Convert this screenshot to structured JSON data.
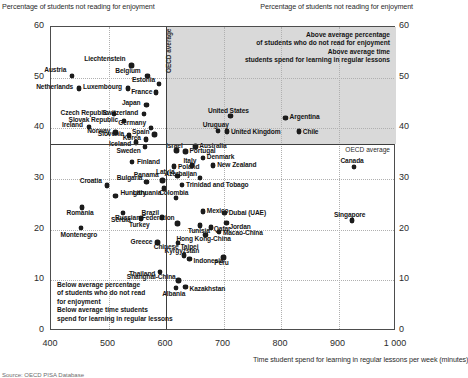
{
  "chart_data": {
    "type": "scatter",
    "title": "",
    "ylabel_left": "Percentage of students not reading for enjoyment",
    "ylabel_right": "Percentage of students not reading for enjoyment",
    "xlabel": "Time student spend for learning in regular lessons per week (minutes)",
    "xlim": [
      400,
      1000
    ],
    "ylim": [
      0,
      60
    ],
    "xticks": [
      400,
      500,
      600,
      700,
      800,
      900,
      1000
    ],
    "yticks": [
      0,
      10,
      20,
      30,
      40,
      50,
      60
    ],
    "grid": true,
    "oecd_average_x": 600,
    "oecd_average_y": 37,
    "oecd_vline_label": "OECD average",
    "oecd_hline_label": "OECD average",
    "annotations": {
      "top_right": "Above average percentage\nof students who do not read for enjoyment\nAbove average time\nstudents spend for learning in regular lessons",
      "bottom_left": "Below average percentage\nof students who do not read\nfor enjoyment\nBelow average time students\nspend for learning in regular lessons"
    },
    "points": [
      {
        "name": "Austria",
        "x": 437,
        "y": 50.3,
        "lx": -6,
        "ly": -7,
        "align": "r"
      },
      {
        "name": "Netherlands",
        "x": 449,
        "y": 47.9,
        "lx": -6,
        "ly": -2,
        "align": "r"
      },
      {
        "name": "Liechtenstein",
        "x": 540,
        "y": 52.4,
        "lx": -6,
        "ly": -7,
        "align": "r"
      },
      {
        "name": "Belgium",
        "x": 568,
        "y": 50.3,
        "lx": -7,
        "ly": -6,
        "align": "r"
      },
      {
        "name": "Luxembourg",
        "x": 534,
        "y": 47.9,
        "lx": -6,
        "ly": -2,
        "align": "r"
      },
      {
        "name": "Estonia",
        "x": 588,
        "y": 48.7,
        "lx": -4,
        "ly": -5,
        "align": "r"
      },
      {
        "name": "France",
        "x": 583,
        "y": 47.1,
        "lx": -4,
        "ly": -1,
        "align": "r"
      },
      {
        "name": "Japan",
        "x": 566,
        "y": 44.6,
        "lx": -6,
        "ly": -3,
        "align": "r"
      },
      {
        "name": "Czech Republic",
        "x": 510,
        "y": 42.8,
        "lx": -6,
        "ly": -2,
        "align": "r"
      },
      {
        "name": "Switzerland",
        "x": 562,
        "y": 42.8,
        "lx": -6,
        "ly": -2,
        "align": "r"
      },
      {
        "name": "Slovak Republic",
        "x": 527,
        "y": 41.4,
        "lx": -6,
        "ly": -2,
        "align": "r"
      },
      {
        "name": "Ireland",
        "x": 466,
        "y": 40.3,
        "lx": -6,
        "ly": -2,
        "align": "r"
      },
      {
        "name": "Germany",
        "x": 574,
        "y": 40.1,
        "lx": -5,
        "ly": -5,
        "align": "r"
      },
      {
        "name": "Norway",
        "x": 512,
        "y": 39.2,
        "lx": -5,
        "ly": -2,
        "align": "r"
      },
      {
        "name": "Spain",
        "x": 580,
        "y": 38.8,
        "lx": -5,
        "ly": -3,
        "align": "r"
      },
      {
        "name": "Slovenia",
        "x": 536,
        "y": 38.6,
        "lx": -5,
        "ly": -2,
        "align": "r"
      },
      {
        "name": "Korea",
        "x": 565,
        "y": 37.8,
        "lx": -5,
        "ly": -2,
        "align": "r"
      },
      {
        "name": "Iceland",
        "x": 548,
        "y": 37.2,
        "lx": -5,
        "ly": 1,
        "align": "r"
      },
      {
        "name": "Sweden",
        "x": 563,
        "y": 36.3,
        "lx": -4,
        "ly": 3,
        "align": "r"
      },
      {
        "name": "Finland",
        "x": 541,
        "y": 33.3,
        "lx": 5,
        "ly": -1,
        "align": "l"
      },
      {
        "name": "Panama",
        "x": 594,
        "y": 29.7,
        "lx": -4,
        "ly": -6,
        "align": "r"
      },
      {
        "name": "Bulgaria",
        "x": 566,
        "y": 29.4,
        "lx": -4,
        "ly": -5,
        "align": "r"
      },
      {
        "name": "Croatia",
        "x": 497,
        "y": 28.7,
        "lx": -5,
        "ly": -5,
        "align": "r"
      },
      {
        "name": "Lithuania",
        "x": 597,
        "y": 28.1,
        "lx": -3,
        "ly": 4,
        "align": "r"
      },
      {
        "name": "Hungary",
        "x": 512,
        "y": 26.6,
        "lx": 5,
        "ly": -4,
        "align": "l"
      },
      {
        "name": "Romania",
        "x": 454,
        "y": 24.4,
        "lx": -2,
        "ly": 5,
        "align": "c"
      },
      {
        "name": "Serbia",
        "x": 525,
        "y": 23.3,
        "lx": -2,
        "ly": 6,
        "align": "c"
      },
      {
        "name": "Turkey",
        "x": 557,
        "y": 22.2,
        "lx": -2,
        "ly": 6,
        "align": "c"
      },
      {
        "name": "Brazil",
        "x": 593,
        "y": 22.4,
        "lx": -3,
        "ly": -5,
        "align": "r"
      },
      {
        "name": "Montenegro",
        "x": 452,
        "y": 20.3,
        "lx": -2,
        "ly": 6,
        "align": "c"
      },
      {
        "name": "Greece",
        "x": 585,
        "y": 17.5,
        "lx": -5,
        "ly": -1,
        "align": "r"
      },
      {
        "name": "Thailand",
        "x": 590,
        "y": 11.6,
        "lx": -5,
        "ly": 1,
        "align": "r"
      },
      {
        "name": "Israel",
        "x": 618,
        "y": 35.6,
        "lx": -2,
        "ly": -5,
        "align": "c"
      },
      {
        "name": "Australia",
        "x": 651,
        "y": 36.4,
        "lx": 4,
        "ly": -1,
        "align": "l"
      },
      {
        "name": "Portugal",
        "x": 634,
        "y": 35.4,
        "lx": 4,
        "ly": -1,
        "align": "l"
      },
      {
        "name": "Denmark",
        "x": 664,
        "y": 34.2,
        "lx": 4,
        "ly": -1,
        "align": "l"
      },
      {
        "name": "Poland",
        "x": 614,
        "y": 32.5,
        "lx": 4,
        "ly": 0,
        "align": "l"
      },
      {
        "name": "Italy",
        "x": 645,
        "y": 32.7,
        "lx": -2,
        "ly": -5,
        "align": "c"
      },
      {
        "name": "New Zealand",
        "x": 682,
        "y": 32.7,
        "lx": 4,
        "ly": -1,
        "align": "l"
      },
      {
        "name": "Latvia",
        "x": 620,
        "y": 30.6,
        "lx": -3,
        "ly": -5,
        "align": "r"
      },
      {
        "name": "Azerbaijan",
        "x": 659,
        "y": 30.2,
        "lx": -3,
        "ly": -5,
        "align": "r"
      },
      {
        "name": "Trinidad and Tobago",
        "x": 628,
        "y": 28.8,
        "lx": 4,
        "ly": -1,
        "align": "l"
      },
      {
        "name": "Colombia",
        "x": 617,
        "y": 26.3,
        "lx": -2,
        "ly": -5,
        "align": "c"
      },
      {
        "name": "Mexico",
        "x": 664,
        "y": 23.6,
        "lx": 4,
        "ly": -1,
        "align": "l"
      },
      {
        "name": "Dubai (UAE)",
        "x": 702,
        "y": 23.3,
        "lx": 4,
        "ly": -1,
        "align": "l"
      },
      {
        "name": "Russian Federation",
        "x": 620,
        "y": 21.2,
        "lx": -3,
        "ly": -6,
        "align": "r"
      },
      {
        "name": "Tunisia",
        "x": 659,
        "y": 20.8,
        "lx": -1,
        "ly": 5,
        "align": "c"
      },
      {
        "name": "Qatar",
        "x": 678,
        "y": 20.4,
        "lx": 3,
        "ly": 1,
        "align": "l"
      },
      {
        "name": "Jordan",
        "x": 705,
        "y": 21.3,
        "lx": 3,
        "ly": 3,
        "align": "l"
      },
      {
        "name": "Macao-China",
        "x": 692,
        "y": 19.6,
        "lx": 4,
        "ly": 1,
        "align": "l"
      },
      {
        "name": "Hong Kong-China",
        "x": 669,
        "y": 19.0,
        "lx": -2,
        "ly": 4,
        "align": "c"
      },
      {
        "name": "Chinese Taipei",
        "x": 621,
        "y": 17.4,
        "lx": -2,
        "ly": 4,
        "align": "c"
      },
      {
        "name": "Kyrgyzstan",
        "x": 631,
        "y": 14.9,
        "lx": -2,
        "ly": -5,
        "align": "c"
      },
      {
        "name": "Indonesia",
        "x": 641,
        "y": 14.2,
        "lx": 4,
        "ly": 1,
        "align": "l"
      },
      {
        "name": "Peru",
        "x": 700,
        "y": 14.5,
        "lx": -2,
        "ly": 5,
        "align": "c"
      },
      {
        "name": "Shanghai-China",
        "x": 622,
        "y": 10.0,
        "lx": -3,
        "ly": -4,
        "align": "r"
      },
      {
        "name": "Kazakhstan",
        "x": 634,
        "y": 8.7,
        "lx": 4,
        "ly": 1,
        "align": "l"
      },
      {
        "name": "Albania",
        "x": 617,
        "y": 8.5,
        "lx": -2,
        "ly": 5,
        "align": "c"
      },
      {
        "name": "Uruguay",
        "x": 690,
        "y": 39.5,
        "lx": -2,
        "ly": -6,
        "align": "c"
      },
      {
        "name": "United States",
        "x": 712,
        "y": 42.4,
        "lx": -2,
        "ly": -6,
        "align": "c"
      },
      {
        "name": "United Kingdom",
        "x": 706,
        "y": 39.4,
        "lx": 4,
        "ly": 0,
        "align": "l"
      },
      {
        "name": "Argentina",
        "x": 808,
        "y": 42.1,
        "lx": 4,
        "ly": -1,
        "align": "l"
      },
      {
        "name": "Chile",
        "x": 831,
        "y": 39.4,
        "lx": 4,
        "ly": 0,
        "align": "l"
      },
      {
        "name": "Canada",
        "x": 927,
        "y": 32.4,
        "lx": -2,
        "ly": -6,
        "align": "c"
      },
      {
        "name": "Singapore",
        "x": 923,
        "y": 21.8,
        "lx": -2,
        "ly": -6,
        "align": "c"
      }
    ]
  },
  "footnote": "Source: OECD PISA Database"
}
